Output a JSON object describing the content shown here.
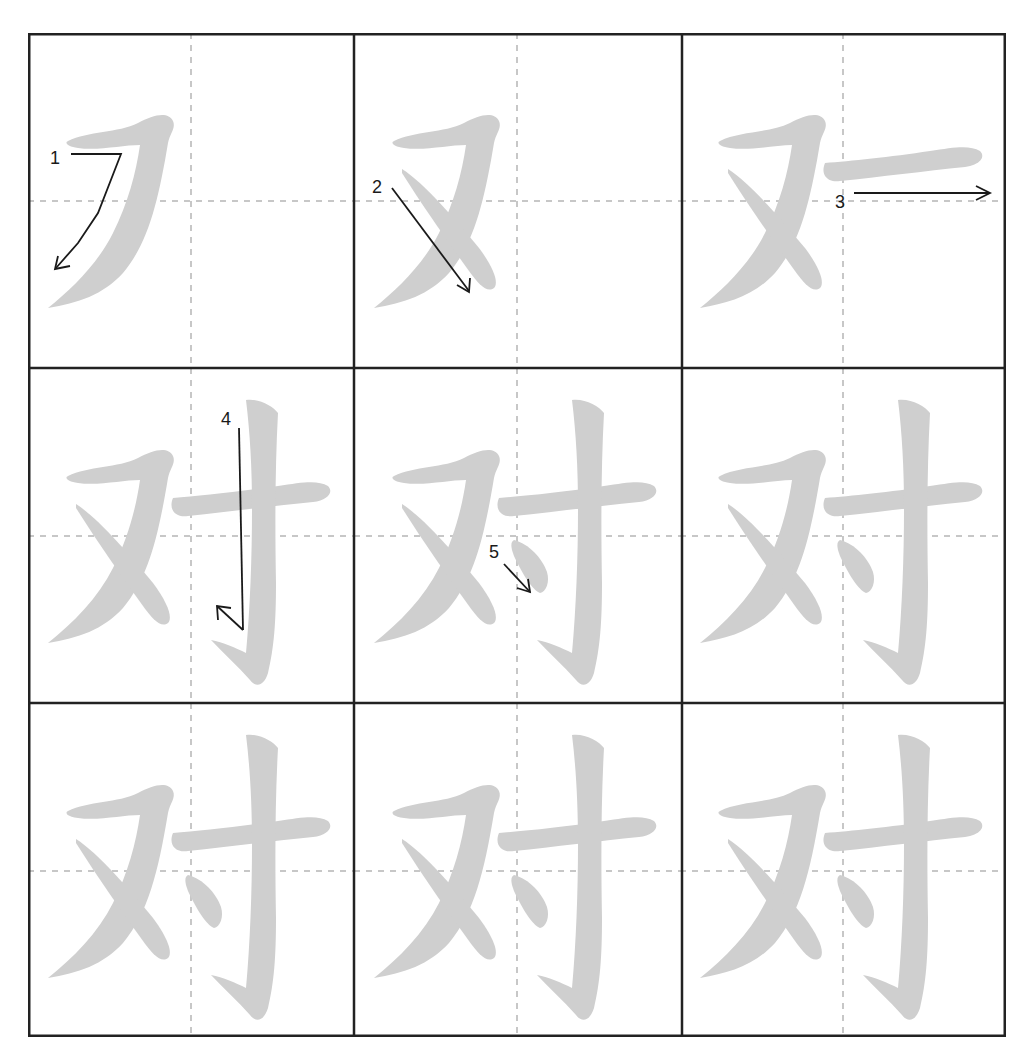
{
  "character": "对",
  "colors": {
    "stroke_fill": "#cfcfcf",
    "arrow": "#1a1a1a",
    "grid": "#222222",
    "guide": "#b5b5b5"
  },
  "cells": [
    {
      "row": 0,
      "col": 0,
      "strokes_shown": 1,
      "label": "1",
      "arrow": "hook-down-left"
    },
    {
      "row": 0,
      "col": 1,
      "strokes_shown": 2,
      "label": "2",
      "arrow": "down-right"
    },
    {
      "row": 0,
      "col": 2,
      "strokes_shown": 3,
      "label": "3",
      "arrow": "right"
    },
    {
      "row": 1,
      "col": 0,
      "strokes_shown": 4,
      "label": "4",
      "arrow": "down-hook"
    },
    {
      "row": 1,
      "col": 1,
      "strokes_shown": 5,
      "label": "5",
      "arrow": "dot-down-right"
    },
    {
      "row": 1,
      "col": 2,
      "strokes_shown": 5,
      "label": "",
      "arrow": ""
    },
    {
      "row": 2,
      "col": 0,
      "strokes_shown": 5,
      "label": "",
      "arrow": ""
    },
    {
      "row": 2,
      "col": 1,
      "strokes_shown": 5,
      "label": "",
      "arrow": ""
    },
    {
      "row": 2,
      "col": 2,
      "strokes_shown": 5,
      "label": "",
      "arrow": ""
    }
  ],
  "labels": {
    "s1": "1",
    "s2": "2",
    "s3": "3",
    "s4": "4",
    "s5": "5"
  }
}
